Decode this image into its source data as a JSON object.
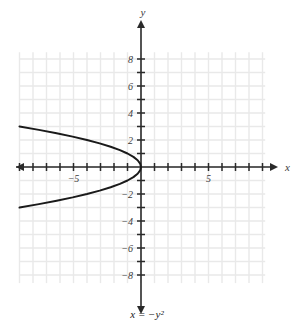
{
  "figure": {
    "caption": "x = −y²",
    "x_axis_label": "x",
    "y_axis_label": "y"
  },
  "chart_data": {
    "type": "line",
    "title": "",
    "equation": "x = -y^2",
    "xlabel": "x",
    "ylabel": "y",
    "xlim": [
      -9.0,
      9.5
    ],
    "ylim": [
      -8.5,
      8.5
    ],
    "grid": true,
    "grid_step": 1,
    "legend": "none",
    "x_ticks": [
      -9,
      -8,
      -7,
      -6,
      -5,
      -4,
      -3,
      -2,
      -1,
      1,
      2,
      3,
      4,
      5,
      6,
      7,
      8,
      9
    ],
    "x_tick_labels": [
      {
        "value": -5,
        "text": "−5"
      },
      {
        "value": 5,
        "text": "5"
      }
    ],
    "y_ticks": [
      -8,
      -7,
      -6,
      -5,
      -4,
      -3,
      -2,
      -1,
      1,
      2,
      3,
      4,
      5,
      6,
      7,
      8
    ],
    "y_tick_labels": [
      {
        "value": 8,
        "text": "8"
      },
      {
        "value": 6,
        "text": "6"
      },
      {
        "value": 4,
        "text": "4"
      },
      {
        "value": 2,
        "text": "2"
      },
      {
        "value": -2,
        "text": "−2"
      },
      {
        "value": -4,
        "text": "−4"
      },
      {
        "value": -6,
        "text": "−6"
      },
      {
        "value": -8,
        "text": "−8"
      }
    ],
    "curve_color": "#1a1a1a",
    "axis_color": "#2a2a2a",
    "grid_color": "#e9e9e9",
    "series": [
      {
        "name": "x = -y^2",
        "points": [
          {
            "y": 3.0,
            "x": -9.0
          },
          {
            "y": 2.75,
            "x": -7.5625
          },
          {
            "y": 2.5,
            "x": -6.25
          },
          {
            "y": 2.25,
            "x": -5.0625
          },
          {
            "y": 2.0,
            "x": -4.0
          },
          {
            "y": 1.75,
            "x": -3.0625
          },
          {
            "y": 1.5,
            "x": -2.25
          },
          {
            "y": 1.25,
            "x": -1.5625
          },
          {
            "y": 1.0,
            "x": -1.0
          },
          {
            "y": 0.75,
            "x": -0.5625
          },
          {
            "y": 0.5,
            "x": -0.25
          },
          {
            "y": 0.25,
            "x": -0.0625
          },
          {
            "y": 0.0,
            "x": 0.0
          },
          {
            "y": -0.25,
            "x": -0.0625
          },
          {
            "y": -0.5,
            "x": -0.25
          },
          {
            "y": -0.75,
            "x": -0.5625
          },
          {
            "y": -1.0,
            "x": -1.0
          },
          {
            "y": -1.25,
            "x": -1.5625
          },
          {
            "y": -1.5,
            "x": -2.25
          },
          {
            "y": -1.75,
            "x": -3.0625
          },
          {
            "y": -2.0,
            "x": -4.0
          },
          {
            "y": -2.25,
            "x": -5.0625
          },
          {
            "y": -2.5,
            "x": -6.25
          },
          {
            "y": -2.75,
            "x": -7.5625
          },
          {
            "y": -3.0,
            "x": -9.0
          }
        ]
      }
    ]
  }
}
